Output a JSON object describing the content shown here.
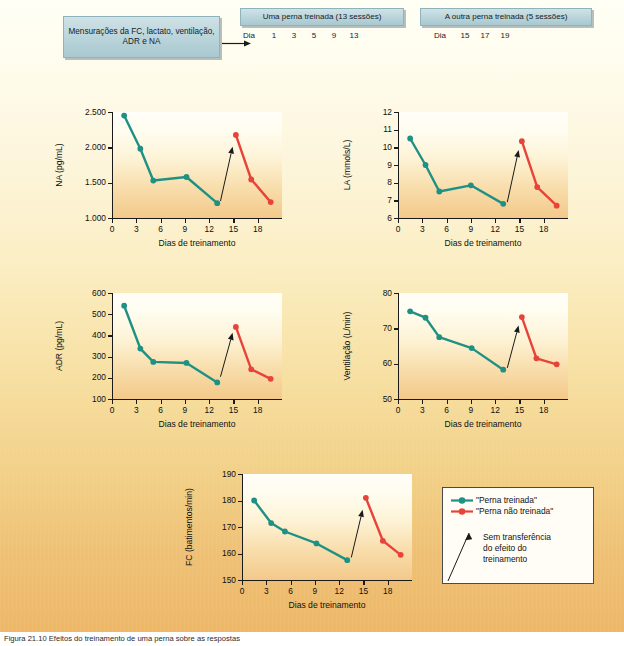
{
  "figure": {
    "caption": "Figura 21.10  Efeitos do treinamento de uma perna sobre as respostas"
  },
  "header": {
    "measure_box": "Mensurações da FC, lactato, ventilação, ADR e NA",
    "leg1_title": "Uma perna treinada (13 sessões)",
    "leg1_day_label": "Dia",
    "leg1_days": [
      "1",
      "3",
      "5",
      "9",
      "13"
    ],
    "leg2_title": "A outra perna treinada (5 sessões)",
    "leg2_day_label": "Dia",
    "leg2_days": [
      "15",
      "17",
      "19"
    ]
  },
  "legend": {
    "trained_label": "\"Perna treinada\"",
    "untrained_label": "\"Perna não treinada\"",
    "note": "Sem transferência\ndo efeito do\ntreinamento",
    "note_line1": "Sem transferência",
    "note_line2": "do efeito do",
    "note_line3": "treinamento"
  },
  "colors": {
    "trained": "#1f9184",
    "untrained": "#e8433a",
    "axis": "#1a1a1a",
    "panel_top": "#fffff5",
    "panel_bottom": "#eeb868",
    "box_fill": "#bdd6dc"
  },
  "chart_data": [
    {
      "id": "na",
      "type": "line",
      "title": "",
      "xlabel": "Dias de treinamento",
      "ylabel": "NA (pg/mL)",
      "xlim": [
        0,
        21
      ],
      "ylim": [
        1000,
        2500
      ],
      "xticks": [
        0,
        3,
        6,
        9,
        12,
        15,
        18
      ],
      "xticklabels": [
        "0",
        "3",
        "6",
        "9",
        "12",
        "15",
        "18"
      ],
      "yticks": [
        1000,
        1500,
        2000,
        2500
      ],
      "yticklabels": [
        "1.000",
        "1.500",
        "2.000",
        "2.500"
      ],
      "grid": false,
      "series": [
        {
          "name": "\"Perna treinada\"",
          "color": "#1f9184",
          "x": [
            1.5,
            3.5,
            5.1,
            9.2,
            13.0
          ],
          "values": [
            2450,
            1980,
            1530,
            1580,
            1210
          ]
        },
        {
          "name": "\"Perna não treinada\"",
          "color": "#e8433a",
          "x": [
            15.3,
            17.2,
            19.6
          ],
          "values": [
            2175,
            1545,
            1225
          ]
        }
      ],
      "annotation": {
        "text": "",
        "arrow_from": [
          13.4,
          1240
        ],
        "arrow_to": [
          14.9,
          2010
        ]
      }
    },
    {
      "id": "la",
      "type": "line",
      "title": "",
      "xlabel": "Dias de treinamento",
      "ylabel": "LA (mmols/L)",
      "xlim": [
        0,
        21
      ],
      "ylim": [
        6,
        12
      ],
      "xticks": [
        0,
        3,
        6,
        9,
        12,
        15,
        18
      ],
      "xticklabels": [
        "0",
        "3",
        "6",
        "9",
        "12",
        "15",
        "18"
      ],
      "yticks": [
        6,
        7,
        8,
        9,
        10,
        11,
        12
      ],
      "yticklabels": [
        "6",
        "7",
        "8",
        "9",
        "10",
        "11",
        "12"
      ],
      "grid": false,
      "series": [
        {
          "name": "\"Perna treinada\"",
          "color": "#1f9184",
          "x": [
            1.5,
            3.4,
            5.1,
            9.0,
            13.0
          ],
          "values": [
            10.5,
            9.0,
            7.5,
            7.85,
            6.8
          ]
        },
        {
          "name": "\"Perna não treinada\"",
          "color": "#e8433a",
          "x": [
            15.3,
            17.2,
            19.6
          ],
          "values": [
            10.35,
            7.75,
            6.7
          ]
        }
      ],
      "annotation": {
        "text": "",
        "arrow_from": [
          13.5,
          6.9
        ],
        "arrow_to": [
          14.9,
          9.85
        ]
      }
    },
    {
      "id": "adr",
      "type": "line",
      "title": "",
      "xlabel": "Dias de treinamento",
      "ylabel": "ADR (pg/mL)",
      "xlim": [
        0,
        21
      ],
      "ylim": [
        100,
        600
      ],
      "xticks": [
        0,
        3,
        6,
        9,
        12,
        15,
        18
      ],
      "xticklabels": [
        "0",
        "3",
        "6",
        "9",
        "12",
        "15",
        "18"
      ],
      "yticks": [
        100,
        200,
        300,
        400,
        500,
        600
      ],
      "yticklabels": [
        "100",
        "200",
        "300",
        "400",
        "500",
        "600"
      ],
      "grid": false,
      "series": [
        {
          "name": "\"Perna treinada\"",
          "color": "#1f9184",
          "x": [
            1.5,
            3.5,
            5.1,
            9.2,
            13.0
          ],
          "values": [
            540,
            338,
            275,
            270,
            178
          ]
        },
        {
          "name": "\"Perna não treinada\"",
          "color": "#e8433a",
          "x": [
            15.3,
            17.2,
            19.6
          ],
          "values": [
            440,
            240,
            195
          ]
        }
      ],
      "annotation": {
        "text": "",
        "arrow_from": [
          13.4,
          205
        ],
        "arrow_to": [
          14.9,
          412
        ]
      }
    },
    {
      "id": "vent",
      "type": "line",
      "title": "",
      "xlabel": "Dias de treinamento",
      "ylabel": "Ventilação (L/min)",
      "xlim": [
        0,
        21
      ],
      "ylim": [
        50,
        80
      ],
      "xticks": [
        0,
        3,
        6,
        9,
        12,
        15,
        18
      ],
      "xticklabels": [
        "0",
        "3",
        "6",
        "9",
        "12",
        "15",
        "18"
      ],
      "yticks": [
        50,
        60,
        70,
        80
      ],
      "yticklabels": [
        "50",
        "60",
        "70",
        "80"
      ],
      "grid": false,
      "series": [
        {
          "name": "\"Perna treinada\"",
          "color": "#1f9184",
          "x": [
            1.5,
            3.4,
            5.1,
            9.1,
            13.0
          ],
          "values": [
            74.8,
            73.0,
            67.5,
            64.4,
            58.3
          ]
        },
        {
          "name": "\"Perna não treinada\"",
          "color": "#e8433a",
          "x": [
            15.3,
            17.1,
            19.6
          ],
          "values": [
            73.2,
            61.5,
            59.8
          ]
        }
      ],
      "annotation": {
        "text": "",
        "arrow_from": [
          13.5,
          58.8
        ],
        "arrow_to": [
          14.9,
          70.8
        ]
      }
    },
    {
      "id": "fc",
      "type": "line",
      "title": "",
      "xlabel": "Dias de treinamento",
      "ylabel": "FC (batimentos/min)",
      "xlim": [
        0,
        21
      ],
      "ylim": [
        150,
        190
      ],
      "xticks": [
        0,
        3,
        6,
        9,
        12,
        15,
        18
      ],
      "xticklabels": [
        "0",
        "3",
        "6",
        "9",
        "12",
        "15",
        "18"
      ],
      "yticks": [
        150,
        160,
        170,
        180,
        190
      ],
      "yticklabels": [
        "150",
        "160",
        "170",
        "180",
        "190"
      ],
      "grid": false,
      "series": [
        {
          "name": "\"Perna treinada\"",
          "color": "#1f9184",
          "x": [
            1.5,
            3.6,
            5.3,
            9.2,
            13.0
          ],
          "values": [
            180.0,
            171.5,
            168.3,
            163.8,
            157.5
          ]
        },
        {
          "name": "\"Perna não treinada\"",
          "color": "#e8433a",
          "x": [
            15.3,
            17.4,
            19.6
          ],
          "values": [
            181.0,
            164.8,
            159.5
          ]
        }
      ],
      "annotation": {
        "text": "",
        "arrow_from": [
          13.5,
          158.5
        ],
        "arrow_to": [
          14.9,
          176.5
        ]
      }
    }
  ]
}
